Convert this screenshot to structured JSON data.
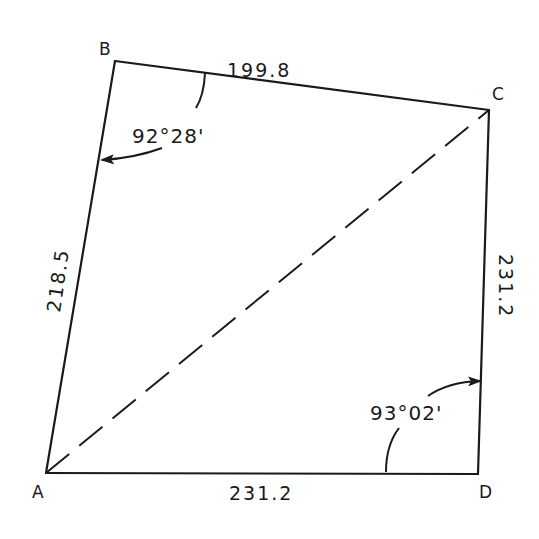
{
  "figure": {
    "type": "survey-quadrilateral",
    "vertices": {
      "A": {
        "label": "A",
        "x": 46,
        "y": 473
      },
      "B": {
        "label": "B",
        "x": 115,
        "y": 61
      },
      "C": {
        "label": "C",
        "x": 489,
        "y": 110
      },
      "D": {
        "label": "D",
        "x": 478,
        "y": 474
      }
    },
    "sides": {
      "AB": {
        "label": "218.5"
      },
      "BC": {
        "label": "199.8"
      },
      "CD": {
        "label": "231.2"
      },
      "DA": {
        "label": "231.2"
      }
    },
    "diagonal": {
      "from": "A",
      "to": "C",
      "style": "dashed"
    },
    "angles": {
      "B": {
        "label": "92°28'"
      },
      "D": {
        "label": "93°02'"
      }
    },
    "colors": {
      "line": "#1a1a1a",
      "background": "#ffffff"
    }
  }
}
